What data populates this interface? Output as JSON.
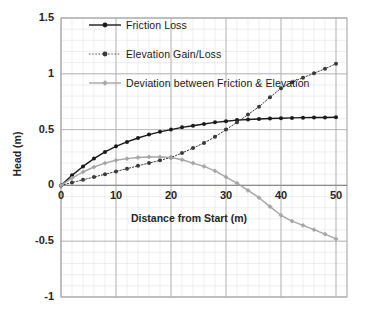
{
  "chart_data": {
    "type": "line",
    "title": "",
    "xlabel": "Distance from Start (m)",
    "ylabel": "Head (m)",
    "xlim": [
      0,
      52
    ],
    "ylim": [
      -1,
      1.5
    ],
    "xticks": [
      "0",
      "10",
      "20",
      "30",
      "40",
      "50"
    ],
    "xtick_values": [
      0,
      10,
      20,
      30,
      40,
      50
    ],
    "yticks": [
      "1.5",
      "1",
      "0.5",
      "0",
      "-0.5",
      "-1"
    ],
    "ytick_values": [
      1.5,
      1,
      0.5,
      0,
      -0.5,
      -1
    ],
    "grid": true,
    "minor_grid": true,
    "x_minor_step": 2,
    "y_minor_step": 0.1,
    "legend_position": "top-left-inside",
    "x": [
      0,
      2,
      4,
      6,
      8,
      10,
      12,
      14,
      16,
      18,
      20,
      22,
      24,
      26,
      28,
      30,
      32,
      34,
      36,
      38,
      40,
      42,
      44,
      46,
      48,
      50
    ],
    "series": [
      {
        "name": "Friction Loss",
        "color": "#1a1a1a",
        "style": "solid",
        "marker": "circle",
        "values": [
          0.0,
          0.09,
          0.17,
          0.24,
          0.3,
          0.35,
          0.39,
          0.425,
          0.455,
          0.48,
          0.5,
          0.52,
          0.535,
          0.55,
          0.565,
          0.575,
          0.585,
          0.59,
          0.595,
          0.6,
          0.602,
          0.605,
          0.607,
          0.608,
          0.609,
          0.61
        ]
      },
      {
        "name": "Elevation Gain/Loss",
        "color": "#3a3a3a",
        "style": "dotted",
        "marker": "circle",
        "values": [
          0.0,
          0.025,
          0.05,
          0.075,
          0.1,
          0.125,
          0.15,
          0.175,
          0.2,
          0.225,
          0.25,
          0.29,
          0.335,
          0.38,
          0.435,
          0.5,
          0.565,
          0.635,
          0.705,
          0.79,
          0.87,
          0.925,
          0.965,
          1.005,
          1.045,
          1.09
        ]
      },
      {
        "name": "Deviation between Friction & Elevation",
        "color": "#a6a6a6",
        "style": "solid",
        "marker": "diamond",
        "values": [
          0.0,
          0.065,
          0.12,
          0.165,
          0.2,
          0.225,
          0.24,
          0.25,
          0.255,
          0.255,
          0.25,
          0.23,
          0.2,
          0.17,
          0.13,
          0.075,
          0.02,
          -0.045,
          -0.11,
          -0.19,
          -0.268,
          -0.32,
          -0.358,
          -0.397,
          -0.436,
          -0.48
        ]
      }
    ]
  }
}
